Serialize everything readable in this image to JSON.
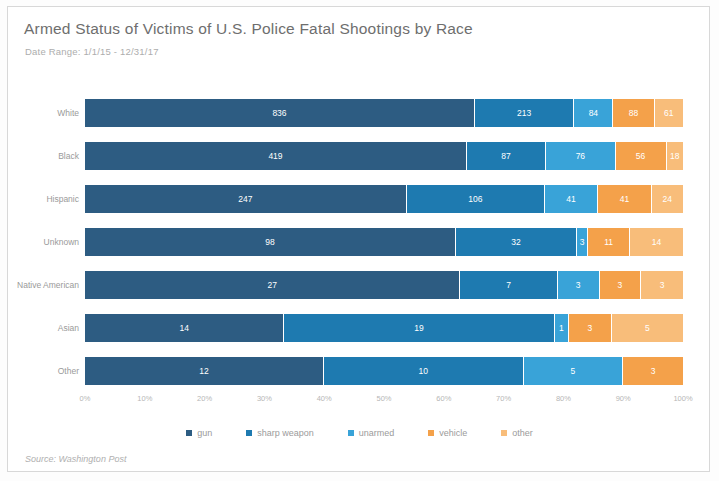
{
  "header": {
    "title": "Armed Status of Victims of U.S. Police Fatal Shootings by Race",
    "subtitle": "Date Range: 1/1/15 - 12/31/17"
  },
  "footer": {
    "source": "Source: Washington Post"
  },
  "colors": {
    "gun": "#2d5c82",
    "sharp_weapon": "#1e7ab0",
    "unarmed": "#39a3d8",
    "vehicle": "#f4a košt",
    "vehicle_hex": "#f4a14a",
    "other": "#f8bd7a",
    "title_text": "#6e6e6e",
    "axis_text": "#b6b6b6",
    "border": "#d8d8d8"
  },
  "chart_data": {
    "type": "bar",
    "orientation": "horizontal",
    "stacked": true,
    "normalized": "100%",
    "title": "Armed Status of Victims of U.S. Police Fatal Shootings by Race",
    "subtitle": "Date Range: 1/1/15 - 12/31/17",
    "xlabel": "",
    "ylabel": "",
    "xlim": [
      0,
      100
    ],
    "grid": false,
    "legend_position": "bottom",
    "xticks": [
      "0%",
      "10%",
      "20%",
      "30%",
      "40%",
      "50%",
      "60%",
      "70%",
      "80%",
      "90%",
      "100%"
    ],
    "categories": [
      "White",
      "Black",
      "Hispanic",
      "Unknown",
      "Native American",
      "Asian",
      "Other"
    ],
    "series": [
      {
        "name": "gun",
        "color": "#2d5c82",
        "values": [
          836,
          419,
          247,
          98,
          27,
          14,
          12
        ]
      },
      {
        "name": "sharp weapon",
        "color": "#1e7ab0",
        "values": [
          213,
          87,
          106,
          32,
          7,
          19,
          10
        ]
      },
      {
        "name": "unarmed",
        "color": "#39a3d8",
        "values": [
          84,
          76,
          41,
          3,
          3,
          1,
          5
        ]
      },
      {
        "name": "vehicle",
        "color": "#f4a14a",
        "values": [
          88,
          56,
          41,
          11,
          3,
          3,
          3
        ]
      },
      {
        "name": "other",
        "color": "#f8bd7a",
        "values": [
          61,
          18,
          24,
          14,
          3,
          5,
          0
        ]
      }
    ]
  },
  "legend": {
    "items": [
      {
        "label": "gun",
        "color": "#2d5c82"
      },
      {
        "label": "sharp weapon",
        "color": "#1e7ab0"
      },
      {
        "label": "unarmed",
        "color": "#39a3d8"
      },
      {
        "label": "vehicle",
        "color": "#f4a14a"
      },
      {
        "label": "other",
        "color": "#f8bd7a"
      }
    ]
  }
}
